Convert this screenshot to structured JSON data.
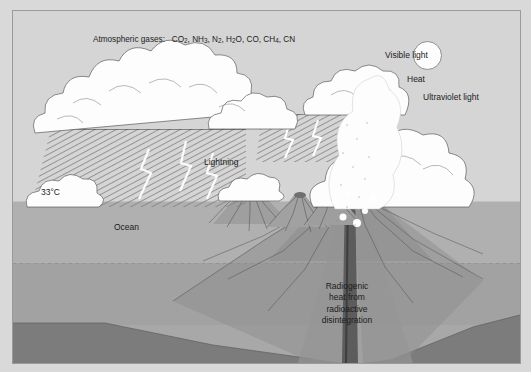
{
  "figure": {
    "kind": "early-earth-primitive-atmosphere-diagram",
    "caption_none": ""
  },
  "labels": {
    "atmospheric_gases_prefix": "Atmospheric gases:",
    "gases": [
      "CO2",
      "NH3",
      "N2",
      "H2O",
      "CO",
      "CH4",
      "CN"
    ],
    "gases_text": "Atmospheric gases:  CO2, NH3, N2, H2O, CO, CH4, CN",
    "visible_light": "Visible light",
    "heat": "Heat",
    "ultraviolet_light": "Ultraviolet light",
    "temperature": "33°C",
    "ocean": "Ocean",
    "lightning": "Lightning",
    "radiogenic_heat": "Radiogenic heat from radioactive disintegration",
    "radiogenic_heat_lines": [
      "Radiogenic",
      "heat from",
      "radioactive",
      "disintegration"
    ]
  },
  "elements": {
    "sun": "sun-circle",
    "clouds": "cumulus-cloud-bank",
    "rain": "diagonal-hatched-rainfall",
    "lightning_bolts": "white-jagged-lightning",
    "volcanoes_small": 3,
    "volcano_main": 1,
    "eruption_plume": "white-stippled-ash-plume",
    "magma_conduit": "vertical-dark-conduit"
  },
  "layers": [
    {
      "name": "sky",
      "label": "atmosphere"
    },
    {
      "name": "ocean",
      "label": "Ocean"
    },
    {
      "name": "crust",
      "label": "crust"
    },
    {
      "name": "mantle-band",
      "label": "dark-layer"
    },
    {
      "name": "deep",
      "label": "deep-interior"
    }
  ],
  "colors": {
    "page_background": "#d9d9d9",
    "frame_border": "#9a9a9a",
    "sky": "#d5d5d5",
    "ocean": "#b0b0b0",
    "crust": "#a2a2a2",
    "dark_band": "#7c7c7c",
    "deep": "#a8a8a8",
    "cloud_fill": "#fdfdfd",
    "ink": "#1b1b1b",
    "line": "#555555"
  }
}
